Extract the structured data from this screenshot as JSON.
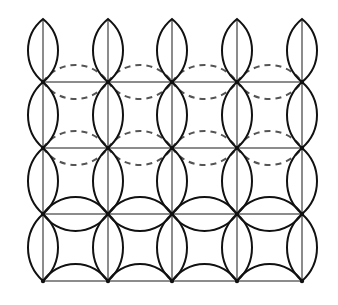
{
  "diagram": {
    "type": "lens-lattice",
    "columns_x": [
      43,
      108,
      172,
      237,
      302
    ],
    "rows_y": [
      19,
      82,
      148,
      214,
      281
    ],
    "vertical_lens_half_width": 15,
    "horizontal_lens_half_height": 17,
    "horizontal_rows": [
      {
        "y": 82,
        "style": "dashed",
        "upper": true,
        "lower": true
      },
      {
        "y": 148,
        "style": "dashed",
        "upper": true,
        "lower": true
      },
      {
        "y": 214,
        "style": "solid",
        "upper": true,
        "lower": true
      },
      {
        "y": 281,
        "style": "solid",
        "upper": true,
        "lower": false
      }
    ],
    "grid_line_rows": [
      82,
      148,
      214,
      281
    ],
    "colors": {
      "solid_stroke": "#111111",
      "dashed_stroke": "#555555",
      "grid_stroke": "#8c8c8c",
      "background": "#ffffff"
    }
  }
}
